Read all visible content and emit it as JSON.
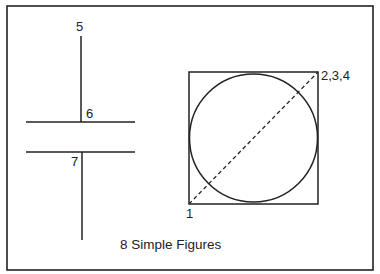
{
  "figure": {
    "caption": "8 Simple Figures",
    "stroke_color": "#222222",
    "background": "#ffffff"
  },
  "labels": {
    "point5": "5",
    "point6": "6",
    "point7": "7",
    "point1": "1",
    "point234": "2,3,4"
  },
  "shapes": {
    "frame": {
      "x": 7,
      "y": 6,
      "w": 366,
      "h": 264
    },
    "upper_tee": {
      "vertical": {
        "x": 81,
        "y1": 36,
        "y2": 122
      },
      "horizontal": {
        "x1": 26,
        "x2": 135,
        "y": 122
      }
    },
    "lower_tee": {
      "vertical": {
        "x": 82,
        "y1": 152,
        "y2": 240
      },
      "horizontal": {
        "x1": 26,
        "x2": 135,
        "y": 152
      }
    },
    "square": {
      "x": 189,
      "y": 72,
      "w": 129,
      "h": 132
    },
    "circle": {
      "cx": 253.5,
      "cy": 138,
      "r": 64
    },
    "diagonal": {
      "x1": 189,
      "y1": 204,
      "x2": 318,
      "y2": 72,
      "style": "dashed"
    }
  }
}
